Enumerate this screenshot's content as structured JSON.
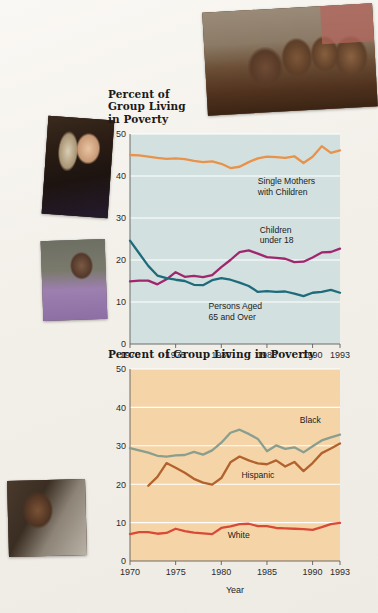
{
  "photos": [
    {
      "name": "photo-children",
      "caption": "Children eating at a table"
    },
    {
      "name": "photo-woman",
      "caption": "Young woman resting head on hands"
    },
    {
      "name": "photo-elder",
      "caption": "Elderly woman in purple top"
    },
    {
      "name": "photo-man",
      "caption": "Man on a city street"
    }
  ],
  "chart_data": [
    {
      "id": "chart-1",
      "type": "line",
      "title": "Percent of\nGroup Living\nin Poverty",
      "title_lines": [
        "Percent of",
        "Group Living",
        "in Poverty"
      ],
      "xlabel": "",
      "ylabel": "",
      "xlim": [
        1970,
        1993
      ],
      "ylim": [
        0,
        50
      ],
      "yticks": [
        0,
        10,
        20,
        30,
        40,
        50
      ],
      "xticks": [
        1970,
        1975,
        1980,
        1985,
        1990,
        1993
      ],
      "xtick_labels": [
        "1970",
        "1975",
        "1980",
        "1985",
        "1990",
        "1993"
      ],
      "grid": "horizontal-white",
      "plot_bg": "#d3e0e0",
      "legend": "inline-annotation",
      "series": [
        {
          "name": "Single Mothers with Children",
          "label_lines": [
            "Single Mothers",
            "with Children"
          ],
          "color": "#E8924A",
          "label_x": 1984.0,
          "label_y": 38.0,
          "x": [
            1970,
            1971,
            1972,
            1973,
            1974,
            1975,
            1976,
            1977,
            1978,
            1979,
            1980,
            1981,
            1982,
            1983,
            1984,
            1985,
            1986,
            1987,
            1988,
            1989,
            1990,
            1991,
            1992,
            1993
          ],
          "values": [
            45.0,
            44.9,
            44.6,
            44.3,
            44.1,
            44.2,
            44.0,
            43.6,
            43.3,
            43.5,
            42.9,
            41.9,
            42.2,
            43.3,
            44.2,
            44.6,
            44.5,
            44.3,
            44.7,
            43.1,
            44.6,
            47.1,
            45.5,
            46.1
          ]
        },
        {
          "name": "Children under 18",
          "label_lines": [
            "Children",
            "under 18"
          ],
          "color": "#A0266E",
          "label_x": 1984.2,
          "label_y": 26.5,
          "x": [
            1970,
            1971,
            1972,
            1973,
            1974,
            1975,
            1976,
            1977,
            1978,
            1979,
            1980,
            1981,
            1982,
            1983,
            1984,
            1985,
            1986,
            1987,
            1988,
            1989,
            1990,
            1991,
            1992,
            1993
          ],
          "values": [
            14.9,
            15.1,
            15.1,
            14.2,
            15.4,
            17.1,
            16.0,
            16.2,
            15.9,
            16.4,
            18.3,
            20.0,
            21.9,
            22.3,
            21.5,
            20.7,
            20.5,
            20.3,
            19.5,
            19.6,
            20.6,
            21.8,
            21.9,
            22.7
          ]
        },
        {
          "name": "Persons Aged 65 and Over",
          "label_lines": [
            "Persons Aged",
            "65 and Over"
          ],
          "color": "#1E6B7B",
          "label_x": 1978.6,
          "label_y": 8.3,
          "x": [
            1970,
            1971,
            1972,
            1973,
            1974,
            1975,
            1976,
            1977,
            1978,
            1979,
            1980,
            1981,
            1982,
            1983,
            1984,
            1985,
            1986,
            1987,
            1988,
            1989,
            1990,
            1991,
            1992,
            1993
          ],
          "values": [
            24.6,
            21.6,
            18.6,
            16.3,
            15.7,
            15.3,
            15.0,
            14.1,
            14.0,
            15.2,
            15.7,
            15.3,
            14.6,
            13.8,
            12.4,
            12.6,
            12.4,
            12.5,
            12.0,
            11.4,
            12.2,
            12.4,
            12.9,
            12.2
          ]
        }
      ]
    },
    {
      "id": "chart-2",
      "type": "line",
      "title": "Percent of Group Living in Poverty",
      "title_lines": [
        "Percent of Group Living in Poverty"
      ],
      "xlabel": "Year",
      "ylabel": "",
      "xlim": [
        1970,
        1993
      ],
      "ylim": [
        0,
        50
      ],
      "yticks": [
        0,
        10,
        20,
        30,
        40,
        50
      ],
      "xticks": [
        1970,
        1975,
        1980,
        1985,
        1990,
        1993
      ],
      "xtick_labels": [
        "1970",
        "1975",
        "1980",
        "1985",
        "1990",
        "1993"
      ],
      "grid": "horizontal-white",
      "plot_bg": "#F5D5A8",
      "legend": "inline-annotation",
      "series": [
        {
          "name": "Black",
          "label_lines": [
            "Black"
          ],
          "color": "#8A9E90",
          "label_x": 1988.6,
          "label_y": 36.0,
          "x": [
            1970,
            1971,
            1972,
            1973,
            1974,
            1975,
            1976,
            1977,
            1978,
            1979,
            1980,
            1981,
            1982,
            1983,
            1984,
            1985,
            1986,
            1987,
            1988,
            1989,
            1990,
            1991,
            1992,
            1993
          ],
          "values": [
            29.4,
            28.8,
            28.2,
            27.4,
            27.2,
            27.5,
            27.6,
            28.4,
            27.7,
            28.8,
            30.8,
            33.4,
            34.2,
            33.1,
            31.8,
            28.6,
            30.1,
            29.2,
            29.6,
            28.3,
            29.9,
            31.4,
            32.2,
            32.9
          ]
        },
        {
          "name": "Hispanic",
          "label_lines": [
            "Hispanic"
          ],
          "color": "#B2622C",
          "label_x": 1982.2,
          "label_y": 21.5,
          "x": [
            1972,
            1973,
            1974,
            1975,
            1976,
            1977,
            1978,
            1979,
            1980,
            1981,
            1982,
            1983,
            1984,
            1985,
            1986,
            1987,
            1988,
            1989,
            1990,
            1991,
            1992,
            1993
          ],
          "values": [
            19.6,
            21.9,
            25.5,
            24.3,
            23.0,
            21.4,
            20.4,
            19.9,
            21.6,
            25.7,
            27.2,
            26.2,
            25.4,
            25.2,
            26.2,
            24.6,
            25.8,
            23.4,
            25.5,
            28.1,
            29.3,
            30.6
          ]
        },
        {
          "name": "White",
          "label_lines": [
            "White"
          ],
          "color": "#D94A36",
          "label_x": 1980.7,
          "label_y": 5.9,
          "x": [
            1970,
            1971,
            1972,
            1973,
            1974,
            1975,
            1976,
            1977,
            1978,
            1979,
            1980,
            1981,
            1982,
            1983,
            1984,
            1985,
            1986,
            1987,
            1988,
            1989,
            1990,
            1991,
            1992,
            1993
          ],
          "values": [
            7.0,
            7.5,
            7.5,
            7.1,
            7.3,
            8.4,
            7.8,
            7.4,
            7.2,
            7.0,
            8.6,
            9.0,
            9.6,
            9.7,
            9.1,
            9.1,
            8.6,
            8.5,
            8.4,
            8.3,
            8.1,
            8.8,
            9.6,
            9.9
          ]
        }
      ]
    }
  ]
}
